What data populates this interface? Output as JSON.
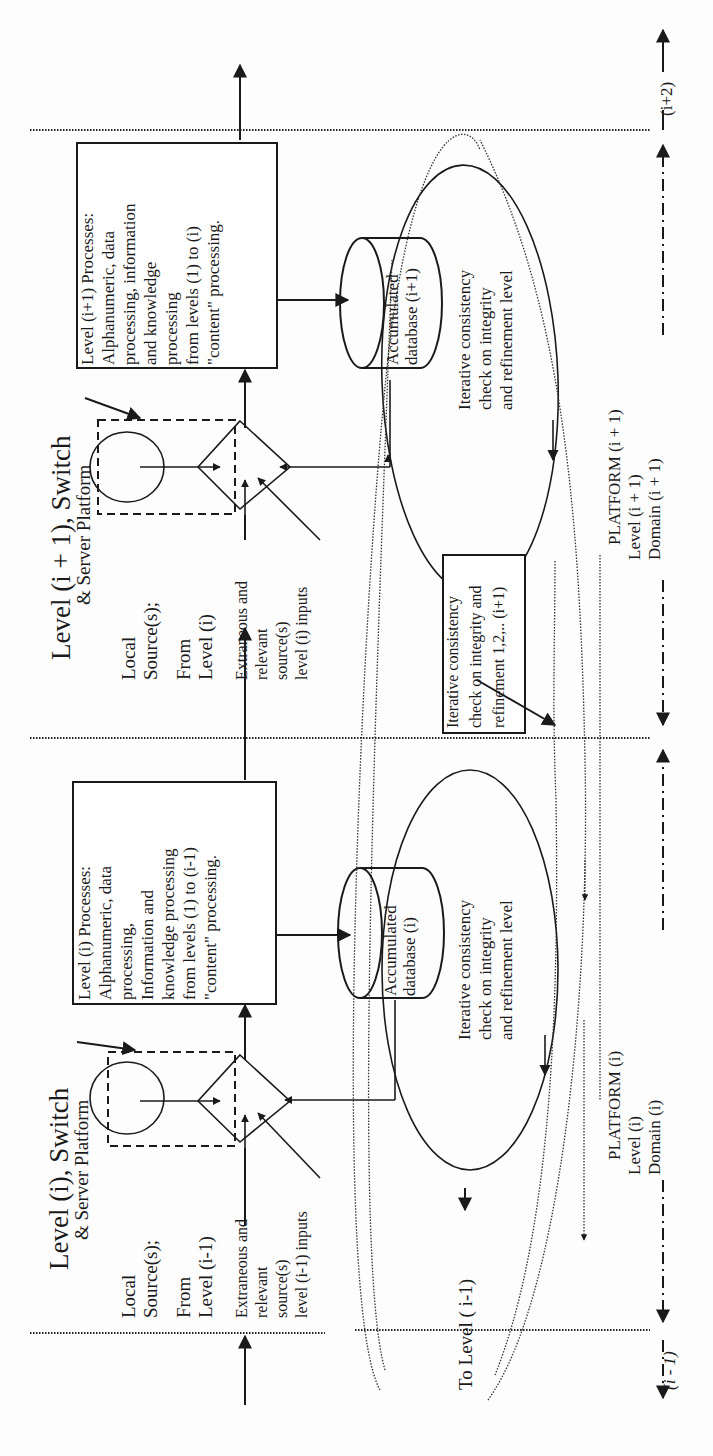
{
  "diagram": {
    "orientation": "rotated-90-ccw",
    "level_i_plus_1": {
      "title": "Level (i + 1), Switch",
      "subtitle": "& Server Platform",
      "local_sources": [
        "Local",
        "Source(s);"
      ],
      "from_level": [
        "From",
        "Level (i)"
      ],
      "extraneous": [
        "Extraneous and",
        "relevant",
        "source(s)",
        "level (i) inputs"
      ],
      "process_box": [
        "Level (i+1) Processes:",
        "Alphanumeric, data",
        "processing, information",
        "and knowledge",
        "processing",
        "from levels (1) to (i)",
        "\"content\" processing."
      ],
      "database": [
        "Accumulated",
        "database (i+1)"
      ],
      "loop_text": [
        "Iterative consistency",
        "check on integrity",
        "and refinement level"
      ],
      "refinement_box": [
        "Iterative consistency",
        "check on integrity and",
        "refinement 1,2,.. (i+1)"
      ],
      "platform": [
        "PLATFORM (i + 1)",
        "Level (i + 1)",
        "Domain (i + 1)"
      ],
      "boundary_label": "(i+2)"
    },
    "level_i": {
      "title": "Level (i), Switch",
      "subtitle": "& Server Platform",
      "local_sources": [
        "Local",
        "Source(s);"
      ],
      "from_level": [
        "From",
        "Level (i-1)"
      ],
      "extraneous": [
        "Extraneous and",
        "relevant",
        "source(s)",
        "level (i-1) inputs"
      ],
      "process_box": [
        "Level (i) Processes:",
        "Alphanumeric, data",
        "processing,",
        "Information and",
        "knowledge processing",
        "from levels (1) to (i-1)",
        "\"content\" processing."
      ],
      "database": [
        "Accumulated",
        "database (i)"
      ],
      "loop_text": [
        "Iterative consistency",
        "check on integrity",
        "and refinement level"
      ],
      "platform": [
        "PLATFORM (i)",
        "Level (i)",
        "Domain (i)"
      ],
      "to_level": "To Level ( i-1)",
      "boundary_label": "(i - 1)"
    }
  }
}
